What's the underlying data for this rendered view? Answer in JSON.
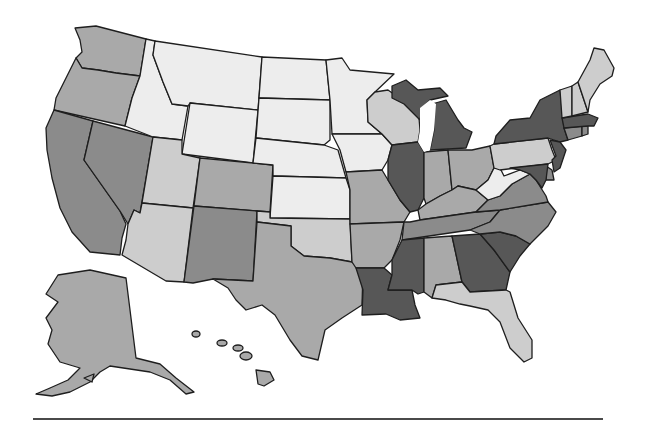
{
  "map": {
    "type": "choropleth",
    "region": "United States",
    "palette": {
      "level1": "#ededed",
      "level2": "#cdcdcd",
      "level3": "#a9a9a9",
      "level4": "#8b8b8b",
      "level5": "#575757"
    },
    "states": {
      "WA": "level3",
      "OR": "level3",
      "CA": "level4",
      "NV": "level4",
      "ID": "level1",
      "MT": "level1",
      "WY": "level1",
      "UT": "level2",
      "AZ": "level2",
      "CO": "level3",
      "NM": "level4",
      "ND": "level1",
      "SD": "level1",
      "NE": "level1",
      "KS": "level1",
      "OK": "level2",
      "TX": "level3",
      "MN": "level1",
      "IA": "level1",
      "MO": "level3",
      "AR": "level3",
      "LA": "level5",
      "WI": "level2",
      "IL": "level5",
      "MI": "level5",
      "IN": "level3",
      "OH": "level3",
      "KY": "level3",
      "TN": "level4",
      "MS": "level5",
      "AL": "level3",
      "GA": "level5",
      "FL": "level2",
      "SC": "level5",
      "NC": "level4",
      "VA": "level4",
      "WV": "level1",
      "PA": "level2",
      "NY": "level5",
      "NJ": "level5",
      "DE": "level4",
      "MD": "level5",
      "CT": "level4",
      "RI": "level4",
      "MA": "level5",
      "VT": "level2",
      "NH": "level2",
      "ME": "level2",
      "AK": "level3",
      "HI": "level3"
    }
  }
}
